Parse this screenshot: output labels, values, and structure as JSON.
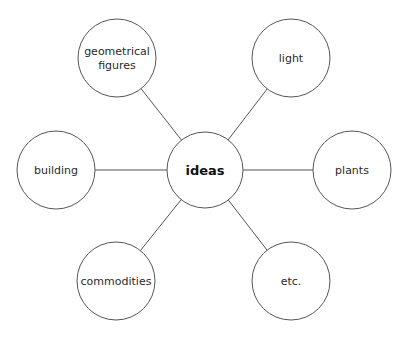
{
  "diagram": {
    "type": "mind-map",
    "center": {
      "label": "ideas",
      "cx": 205,
      "cy": 170,
      "r": 38
    },
    "nodes": [
      {
        "id": "geometrical-figures",
        "lines": [
          "geometrical",
          "figures"
        ],
        "cx": 117,
        "cy": 58,
        "r": 39
      },
      {
        "id": "light",
        "lines": [
          "light"
        ],
        "cx": 291,
        "cy": 58,
        "r": 39
      },
      {
        "id": "building",
        "lines": [
          "building"
        ],
        "cx": 56,
        "cy": 170,
        "r": 39
      },
      {
        "id": "plants",
        "lines": [
          "plants"
        ],
        "cx": 352,
        "cy": 170,
        "r": 39
      },
      {
        "id": "commodities",
        "lines": [
          "commodities"
        ],
        "cx": 116,
        "cy": 281,
        "r": 39
      },
      {
        "id": "etc",
        "lines": [
          "etc."
        ],
        "cx": 291,
        "cy": 281,
        "r": 39
      }
    ],
    "colors": {
      "stroke": "#555555",
      "text": "#2a2a2a",
      "center_text": "#111111",
      "background": "#ffffff"
    }
  }
}
